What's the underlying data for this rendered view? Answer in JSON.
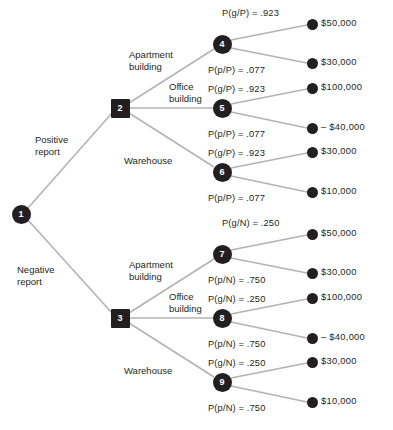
{
  "diagram": {
    "colors": {
      "node_fill": "#231f20",
      "node_text": "#ffffff",
      "edge": "#b3b3b3",
      "label_text": "#231f20",
      "background": "#ffffff"
    },
    "nodes": [
      {
        "id": "node-1",
        "label": "1",
        "kind": "chance",
        "x": 21,
        "y": 214
      },
      {
        "id": "node-2",
        "label": "2",
        "kind": "decision",
        "x": 120,
        "y": 108
      },
      {
        "id": "node-3",
        "label": "3",
        "kind": "decision",
        "x": 120,
        "y": 318
      },
      {
        "id": "node-4",
        "label": "4",
        "kind": "chance",
        "x": 222,
        "y": 44
      },
      {
        "id": "node-5",
        "label": "5",
        "kind": "chance",
        "x": 222,
        "y": 108
      },
      {
        "id": "node-6",
        "label": "6",
        "kind": "chance",
        "x": 222,
        "y": 172
      },
      {
        "id": "node-7",
        "label": "7",
        "kind": "chance",
        "x": 222,
        "y": 254
      },
      {
        "id": "node-8",
        "label": "8",
        "kind": "chance",
        "x": 222,
        "y": 318
      },
      {
        "id": "node-9",
        "label": "9",
        "kind": "chance",
        "x": 222,
        "y": 382
      }
    ],
    "terminals": [
      {
        "id": "terminal-1",
        "payoff": "$50,000",
        "x": 312,
        "y": 24
      },
      {
        "id": "terminal-2",
        "payoff": "$30,000",
        "x": 312,
        "y": 63
      },
      {
        "id": "terminal-3",
        "payoff": "$100,000",
        "x": 312,
        "y": 88
      },
      {
        "id": "terminal-4",
        "payoff": "– $40,000",
        "x": 312,
        "y": 128
      },
      {
        "id": "terminal-5",
        "payoff": "$30,000",
        "x": 312,
        "y": 152
      },
      {
        "id": "terminal-6",
        "payoff": "$10,000",
        "x": 312,
        "y": 192
      },
      {
        "id": "terminal-7",
        "payoff": "$50,000",
        "x": 312,
        "y": 234
      },
      {
        "id": "terminal-8",
        "payoff": "$30,000",
        "x": 312,
        "y": 273
      },
      {
        "id": "terminal-9",
        "payoff": "$100,000",
        "x": 312,
        "y": 298
      },
      {
        "id": "terminal-10",
        "payoff": "– $40,000",
        "x": 312,
        "y": 338
      },
      {
        "id": "terminal-11",
        "payoff": "$30,000",
        "x": 312,
        "y": 362
      },
      {
        "id": "terminal-12",
        "payoff": "$10,000",
        "x": 312,
        "y": 402
      }
    ],
    "branch_labels": [
      {
        "id": "branch-positive-report",
        "line1": "Positive",
        "line2": "report",
        "x": 35,
        "y": 134
      },
      {
        "id": "branch-negative-report",
        "line1": "Negative",
        "line2": "report",
        "x": 17,
        "y": 264
      },
      {
        "id": "branch-apartment-top",
        "line1": "Apartment",
        "line2": "building",
        "x": 129,
        "y": 49
      },
      {
        "id": "branch-office-top",
        "line1": "Office",
        "line2": "building",
        "x": 169,
        "y": 81
      },
      {
        "id": "branch-warehouse-top",
        "line1": "Warehouse",
        "line2": "",
        "x": 124,
        "y": 155
      },
      {
        "id": "branch-apartment-bottom",
        "line1": "Apartment",
        "line2": "building",
        "x": 129,
        "y": 259
      },
      {
        "id": "branch-office-bottom",
        "line1": "Office",
        "line2": "building",
        "x": 169,
        "y": 291
      },
      {
        "id": "branch-warehouse-bottom",
        "line1": "Warehouse",
        "line2": "",
        "x": 124,
        "y": 365
      }
    ],
    "probability_labels": [
      {
        "id": "prob-4-good",
        "text": "P(g/P) = .923",
        "x": 222,
        "y": 8
      },
      {
        "id": "prob-4-poor",
        "text": "P(p/P) = .077",
        "x": 208,
        "y": 65
      },
      {
        "id": "prob-5-good",
        "text": "P(g/P) = .923",
        "x": 208,
        "y": 84
      },
      {
        "id": "prob-5-poor",
        "text": "P(p/P) = .077",
        "x": 208,
        "y": 129
      },
      {
        "id": "prob-6-good",
        "text": "P(g/P) = .923",
        "x": 208,
        "y": 148
      },
      {
        "id": "prob-6-poor",
        "text": "P(p/P) = .077",
        "x": 208,
        "y": 193
      },
      {
        "id": "prob-7-good",
        "text": "P(g/N) = .250",
        "x": 222,
        "y": 218
      },
      {
        "id": "prob-7-poor",
        "text": "P(p/N) = .750",
        "x": 208,
        "y": 275
      },
      {
        "id": "prob-8-good",
        "text": "P(g/N) = .250",
        "x": 208,
        "y": 294
      },
      {
        "id": "prob-8-poor",
        "text": "P(p/N) = .750",
        "x": 208,
        "y": 339
      },
      {
        "id": "prob-9-good",
        "text": "P(g/N) = .250",
        "x": 208,
        "y": 358
      },
      {
        "id": "prob-9-poor",
        "text": "P(p/N) = .750",
        "x": 208,
        "y": 403
      }
    ],
    "edges": [
      {
        "id": "edge-1-2",
        "from": "node-1",
        "to": "node-2",
        "x1": 28,
        "y1": 208,
        "x2": 112,
        "y2": 113
      },
      {
        "id": "edge-1-3",
        "from": "node-1",
        "to": "node-3",
        "x1": 28,
        "y1": 220,
        "x2": 112,
        "y2": 313
      },
      {
        "id": "edge-2-4",
        "from": "node-2",
        "to": "node-4",
        "x1": 129,
        "y1": 103,
        "x2": 214,
        "y2": 49
      },
      {
        "id": "edge-2-5",
        "from": "node-2",
        "to": "node-5",
        "x1": 129,
        "y1": 108,
        "x2": 213,
        "y2": 108
      },
      {
        "id": "edge-2-6",
        "from": "node-2",
        "to": "node-6",
        "x1": 129,
        "y1": 113,
        "x2": 214,
        "y2": 167
      },
      {
        "id": "edge-3-7",
        "from": "node-3",
        "to": "node-7",
        "x1": 129,
        "y1": 313,
        "x2": 214,
        "y2": 259
      },
      {
        "id": "edge-3-8",
        "from": "node-3",
        "to": "node-8",
        "x1": 129,
        "y1": 318,
        "x2": 213,
        "y2": 318
      },
      {
        "id": "edge-3-9",
        "from": "node-3",
        "to": "node-9",
        "x1": 129,
        "y1": 323,
        "x2": 214,
        "y2": 377
      },
      {
        "id": "edge-4-t1",
        "from": "node-4",
        "to": "terminal-1",
        "x1": 231,
        "y1": 40,
        "x2": 307,
        "y2": 25
      },
      {
        "id": "edge-4-t2",
        "from": "node-4",
        "to": "terminal-2",
        "x1": 231,
        "y1": 48,
        "x2": 307,
        "y2": 63
      },
      {
        "id": "edge-5-t3",
        "from": "node-5",
        "to": "terminal-3",
        "x1": 231,
        "y1": 104,
        "x2": 307,
        "y2": 89
      },
      {
        "id": "edge-5-t4",
        "from": "node-5",
        "to": "terminal-4",
        "x1": 231,
        "y1": 112,
        "x2": 307,
        "y2": 128
      },
      {
        "id": "edge-6-t5",
        "from": "node-6",
        "to": "terminal-5",
        "x1": 231,
        "y1": 168,
        "x2": 307,
        "y2": 153
      },
      {
        "id": "edge-6-t6",
        "from": "node-6",
        "to": "terminal-6",
        "x1": 231,
        "y1": 176,
        "x2": 307,
        "y2": 192
      },
      {
        "id": "edge-7-t7",
        "from": "node-7",
        "to": "terminal-7",
        "x1": 231,
        "y1": 250,
        "x2": 307,
        "y2": 235
      },
      {
        "id": "edge-7-t8",
        "from": "node-7",
        "to": "terminal-8",
        "x1": 231,
        "y1": 258,
        "x2": 307,
        "y2": 273
      },
      {
        "id": "edge-8-t9",
        "from": "node-8",
        "to": "terminal-9",
        "x1": 231,
        "y1": 314,
        "x2": 307,
        "y2": 299
      },
      {
        "id": "edge-8-t10",
        "from": "node-8",
        "to": "terminal-10",
        "x1": 231,
        "y1": 322,
        "x2": 307,
        "y2": 338
      },
      {
        "id": "edge-9-t11",
        "from": "node-9",
        "to": "terminal-11",
        "x1": 231,
        "y1": 378,
        "x2": 307,
        "y2": 363
      },
      {
        "id": "edge-9-t12",
        "from": "node-9",
        "to": "terminal-12",
        "x1": 231,
        "y1": 386,
        "x2": 307,
        "y2": 402
      }
    ]
  }
}
